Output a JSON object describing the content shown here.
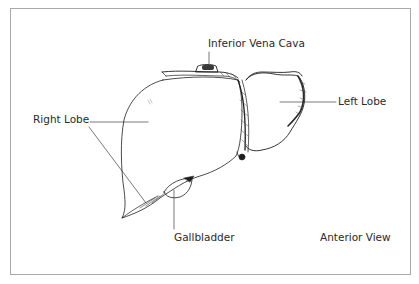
{
  "figure": {
    "view": "Anterior View",
    "labels": {
      "ivc": "Inferior Vena Cava",
      "left_lobe": "Left Lobe",
      "right_lobe": "Right Lobe",
      "gallbladder": "Gallbladder"
    },
    "colors": {
      "frame": "#a9a9a9",
      "ink": "#1e1e1e",
      "background": "#ffffff"
    }
  }
}
